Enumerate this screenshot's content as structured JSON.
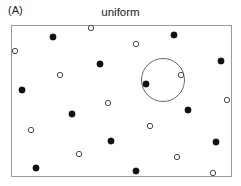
{
  "figure": {
    "panel_label": "(A)",
    "title": "uniform",
    "frame": {
      "x": 11,
      "y": 25,
      "width": 220,
      "height": 151
    },
    "colors": {
      "frame_stroke": "#9a9a9a",
      "filled_point": "#111111",
      "open_point_stroke": "#4a4a4a",
      "open_point_fill": "#ffffff",
      "annotation_circle": "#6b6b6b",
      "background": "#ffffff",
      "text": "#1c1c1c"
    }
  },
  "chart_data": {
    "type": "scatter",
    "title": "uniform",
    "subtitle": "",
    "xlabel": "",
    "ylabel": "",
    "xlim": [
      11,
      231
    ],
    "ylim": [
      25,
      176
    ],
    "grid": false,
    "axis_ticks": false,
    "legend": null,
    "legend_position": "none",
    "point_radius_filled": 3.2,
    "point_radius_open": 2.7,
    "annotations": [
      {
        "name": "sampling-circle",
        "shape": "circle",
        "cx": 163,
        "cy": 80,
        "r": 21.5,
        "filled": false
      }
    ],
    "series": [
      {
        "name": "filled",
        "marker": "filled-circle",
        "color": "#111111",
        "points": [
          {
            "x": 53,
            "y": 37
          },
          {
            "x": 174,
            "y": 35
          },
          {
            "x": 100,
            "y": 64
          },
          {
            "x": 221,
            "y": 61
          },
          {
            "x": 146,
            "y": 84
          },
          {
            "x": 22,
            "y": 90
          },
          {
            "x": 72,
            "y": 114
          },
          {
            "x": 188,
            "y": 110
          },
          {
            "x": 111,
            "y": 141
          },
          {
            "x": 216,
            "y": 142
          },
          {
            "x": 36,
            "y": 168
          },
          {
            "x": 136,
            "y": 171
          }
        ]
      },
      {
        "name": "open",
        "marker": "open-circle",
        "color": "#4a4a4a",
        "points": [
          {
            "x": 91,
            "y": 28
          },
          {
            "x": 136,
            "y": 44
          },
          {
            "x": 15,
            "y": 51
          },
          {
            "x": 60,
            "y": 75
          },
          {
            "x": 181,
            "y": 75
          },
          {
            "x": 108,
            "y": 103
          },
          {
            "x": 227,
            "y": 100
          },
          {
            "x": 31,
            "y": 130
          },
          {
            "x": 150,
            "y": 126
          },
          {
            "x": 79,
            "y": 154
          },
          {
            "x": 177,
            "y": 157
          },
          {
            "x": 213,
            "y": 173
          }
        ]
      }
    ]
  }
}
